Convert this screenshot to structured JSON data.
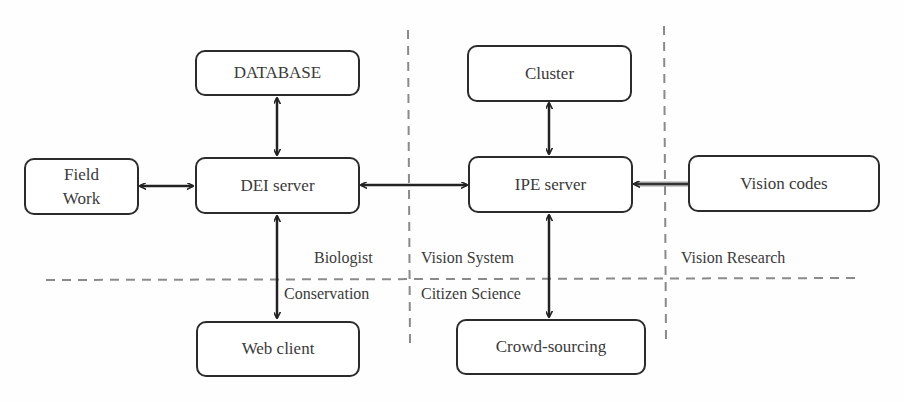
{
  "nodes": {
    "database": "DATABASE",
    "field_work": "Field\nWork",
    "dei_server": "DEI server",
    "web_client": "Web client",
    "cluster": "Cluster",
    "ipe_server": "IPE server",
    "vision_codes": "Vision codes",
    "crowd_sourcing": "Crowd-sourcing"
  },
  "region_labels": {
    "biologist": "Biologist",
    "conservation": "Conservation",
    "vision_system": "Vision System",
    "citizen_science": "Citizen Science",
    "vision_research": "Vision Research"
  },
  "edges": [
    {
      "from": "database",
      "to": "dei_server",
      "direction": "bidirectional"
    },
    {
      "from": "field_work",
      "to": "dei_server",
      "direction": "bidirectional"
    },
    {
      "from": "dei_server",
      "to": "ipe_server",
      "direction": "bidirectional"
    },
    {
      "from": "dei_server",
      "to": "web_client",
      "direction": "bidirectional"
    },
    {
      "from": "cluster",
      "to": "ipe_server",
      "direction": "bidirectional"
    },
    {
      "from": "ipe_server",
      "to": "crowd_sourcing",
      "direction": "bidirectional"
    },
    {
      "from": "vision_codes",
      "to": "ipe_server",
      "direction": "one-way"
    }
  ],
  "colors": {
    "box_border": "#2b2b2b",
    "arrow": "#222222",
    "dashed_divider": "#8a8a8a",
    "text": "#3a3a3a"
  }
}
